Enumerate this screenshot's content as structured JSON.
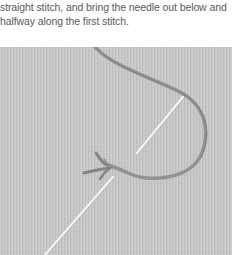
{
  "caption": {
    "lines": [
      "straight stitch, and bring the needle out below and",
      "halfway along the first stitch."
    ]
  },
  "illustration": {
    "subject": "embroidery-photo",
    "elements": [
      "fabric",
      "thread-loop",
      "needle-upper",
      "needle-lower",
      "stitch-knot"
    ],
    "colors": {
      "fabric": "#c9c9c9",
      "thread": "#8a8a8a",
      "needle": "#f4f4f4"
    }
  }
}
